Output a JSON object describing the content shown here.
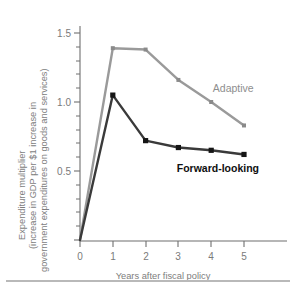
{
  "chart_data": {
    "type": "line",
    "title": "",
    "xlabel": "Years after fiscal policy",
    "ylabel_line1": "Expenditure multiplier",
    "ylabel_line2": "(increase in GDP per $1 increase in",
    "ylabel_line3": "government expenditures on goods and services)",
    "x": [
      0,
      1,
      2,
      3,
      4,
      5
    ],
    "xlim": [
      0,
      5.6
    ],
    "ylim": [
      0,
      1.62
    ],
    "xticks": [
      "0",
      "1",
      "2",
      "3",
      "4",
      "5"
    ],
    "yticks": [
      "0",
      "0.5",
      "1.0",
      "1.5"
    ],
    "ytick_values": [
      0,
      0.5,
      1.0,
      1.5
    ],
    "yminor_step": 0.1,
    "grid": false,
    "legend_position": "inline-annotation",
    "series": [
      {
        "name": "Adaptive",
        "color": "#9a9a9a",
        "values": [
          0.0,
          1.39,
          1.38,
          1.16,
          1.0,
          0.83
        ],
        "label": "Adaptive",
        "label_x": 4.05,
        "label_y": 1.07
      },
      {
        "name": "Forward-looking",
        "color": "#3a3a3a",
        "values": [
          0.0,
          1.05,
          0.72,
          0.67,
          0.65,
          0.62
        ],
        "label": "Forward-looking",
        "label_x": 2.95,
        "label_y": 0.49
      }
    ]
  },
  "colors": {
    "adaptive": "#9a9a9a",
    "forward_looking": "#3a3a3a",
    "axis": "#6f6f6f",
    "tick_text": "#7a7a7a",
    "axis_title": "#7d7d7d",
    "footer_rule": "#b9b9b9",
    "background": "#ffffff"
  }
}
